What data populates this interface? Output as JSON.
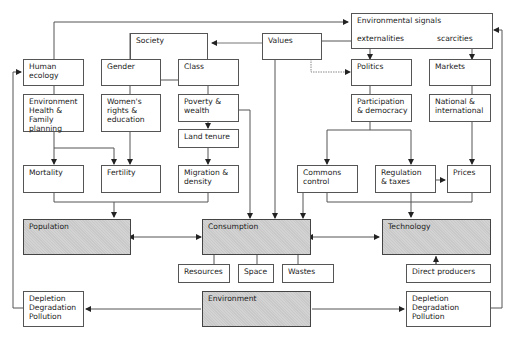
{
  "diagram": {
    "boxes": {
      "environmental_signals": "Environmental signals",
      "externalities": "externalities",
      "scarcities": "scarcities",
      "society": "Society",
      "values": "Values",
      "human_ecology": "Human\necology",
      "gender": "Gender",
      "class": "Class",
      "politics": "Politics",
      "markets": "Markets",
      "env_health_family": "Environment\nHealth &\nFamily\nplanning",
      "womens_rights": "Women's\nrights &\neducation",
      "poverty_wealth": "Poverty &\nwealth",
      "land_tenure": "Land tenure",
      "participation": "Participation\n& democracy",
      "national_international": "National &\ninternational",
      "mortality": "Mortality",
      "fertility": "Fertility",
      "migration": "Migration &\ndensity",
      "commons_control": "Commons\ncontrol",
      "regulation_taxes": "Regulation\n& taxes",
      "prices": "Prices",
      "population": "Population",
      "consumption": "Consumption",
      "technology": "Technology",
      "resources": "Resources",
      "space": "Space",
      "wastes": "Wastes",
      "direct_producers": "Direct producers",
      "environment": "Environment",
      "depletion_left": "Depletion\nDegradation\nPollution",
      "depletion_right": "Depletion\nDegradation\nPollution"
    },
    "colors": {
      "line": "#555555",
      "shaded_fill": "#c9c9c9",
      "values_arrow": "#777777"
    }
  }
}
